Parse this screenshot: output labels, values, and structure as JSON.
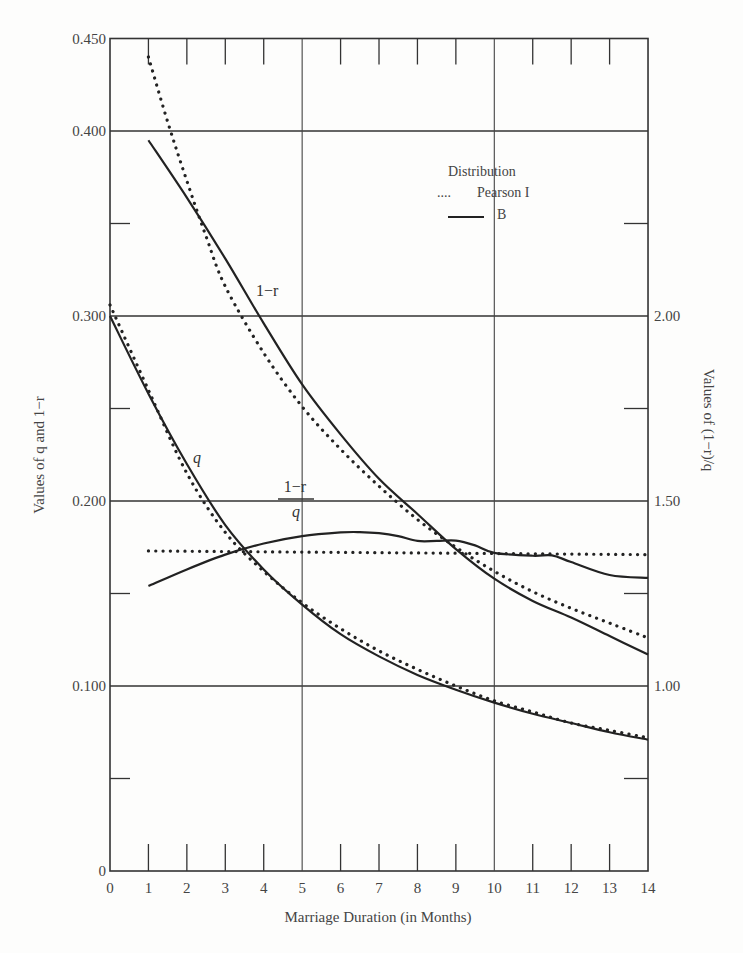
{
  "chart_data": {
    "type": "line",
    "title": "",
    "xlabel": "Marriage Duration (in Months)",
    "ylabel_left": "Values of q and 1−r",
    "ylabel_right": "Values of (1−r)/q",
    "xlim": [
      0,
      14
    ],
    "ylim_left": [
      0,
      0.45
    ],
    "ylim_right": [
      0.5,
      2.0
    ],
    "x_ticks": [
      "0",
      "1",
      "2",
      "3",
      "4",
      "5",
      "6",
      "7",
      "8",
      "9",
      "10",
      "11",
      "12",
      "13",
      "14"
    ],
    "y_left_ticks": [
      {
        "value": 0,
        "label": "0"
      },
      {
        "value": 0.1,
        "label": "0.100"
      },
      {
        "value": 0.2,
        "label": "0.200"
      },
      {
        "value": 0.3,
        "label": "0.300"
      },
      {
        "value": 0.4,
        "label": "0.400"
      },
      {
        "value": 0.45,
        "label": "0.450"
      }
    ],
    "y_right_ticks": [
      {
        "value": 1.0,
        "label": "1.00"
      },
      {
        "value": 1.5,
        "label": "1.50"
      },
      {
        "value": 2.0,
        "label": "2.00"
      }
    ],
    "grid": {
      "vertical_at": [
        5,
        10
      ],
      "horizontal_at": [
        0.1,
        0.2,
        0.3,
        0.4
      ]
    },
    "legend": {
      "title": "Distribution",
      "entries": [
        {
          "marker": "....",
          "style": "dotted",
          "label": "Pearson I"
        },
        {
          "marker": "—",
          "style": "solid",
          "label": "B"
        }
      ]
    },
    "annotations": [
      {
        "text": "1−r",
        "month": 3.95,
        "value": 0.318
      },
      {
        "text": "q",
        "month": 2.35,
        "value": 0.222
      },
      {
        "text_num": "1−r",
        "text_den": "q",
        "month": 4.65,
        "value": 0.2
      }
    ],
    "series": [
      {
        "name": "1−r (B)",
        "axis": "left",
        "style": "solid",
        "x": [
          1,
          2,
          3,
          4,
          5,
          6,
          7,
          8,
          9,
          10,
          11,
          12,
          13,
          14
        ],
        "values": [
          0.395,
          0.364,
          0.331,
          0.296,
          0.263,
          0.236,
          0.212,
          0.193,
          0.174,
          0.158,
          0.146,
          0.137,
          0.127,
          0.117
        ]
      },
      {
        "name": "1−r (Pearson I)",
        "axis": "left",
        "style": "dotted",
        "x": [
          1,
          1.5,
          2,
          2.5,
          3,
          4,
          5,
          6,
          7,
          8,
          9,
          10,
          11,
          12,
          13,
          14
        ],
        "values": [
          0.44,
          0.405,
          0.373,
          0.343,
          0.316,
          0.28,
          0.251,
          0.228,
          0.208,
          0.19,
          0.175,
          0.162,
          0.151,
          0.142,
          0.134,
          0.126
        ]
      },
      {
        "name": "q (B)",
        "axis": "left",
        "style": "solid",
        "x": [
          0,
          1,
          2,
          3,
          4,
          5,
          6,
          7,
          8,
          9,
          10,
          11,
          12,
          13,
          14
        ],
        "values": [
          0.3,
          0.258,
          0.22,
          0.187,
          0.163,
          0.144,
          0.128,
          0.116,
          0.106,
          0.098,
          0.091,
          0.085,
          0.08,
          0.075,
          0.071
        ]
      },
      {
        "name": "q (Pearson I)",
        "axis": "left",
        "style": "dotted",
        "x": [
          0,
          1,
          2,
          3,
          4,
          5,
          6,
          7,
          8,
          9,
          10,
          11,
          12,
          13,
          14
        ],
        "values": [
          0.306,
          0.26,
          0.215,
          0.183,
          0.162,
          0.145,
          0.131,
          0.119,
          0.109,
          0.1,
          0.092,
          0.086,
          0.08,
          0.076,
          0.072
        ]
      },
      {
        "name": "(1−r)/q (B)",
        "axis": "right",
        "style": "solid",
        "x": [
          1,
          2,
          3,
          4,
          5,
          6,
          6.5,
          7,
          7.5,
          8,
          8.5,
          9,
          9.5,
          10,
          11,
          11.5,
          12,
          13,
          14
        ],
        "values": [
          1.27,
          1.315,
          1.355,
          1.385,
          1.405,
          1.415,
          1.416,
          1.413,
          1.405,
          1.392,
          1.392,
          1.393,
          1.38,
          1.36,
          1.352,
          1.353,
          1.335,
          1.3,
          1.292
        ]
      },
      {
        "name": "(1−r)/q (Pearson I)",
        "axis": "right",
        "style": "dotted",
        "x": [
          1,
          14
        ],
        "values": [
          1.365,
          1.355
        ]
      }
    ]
  }
}
